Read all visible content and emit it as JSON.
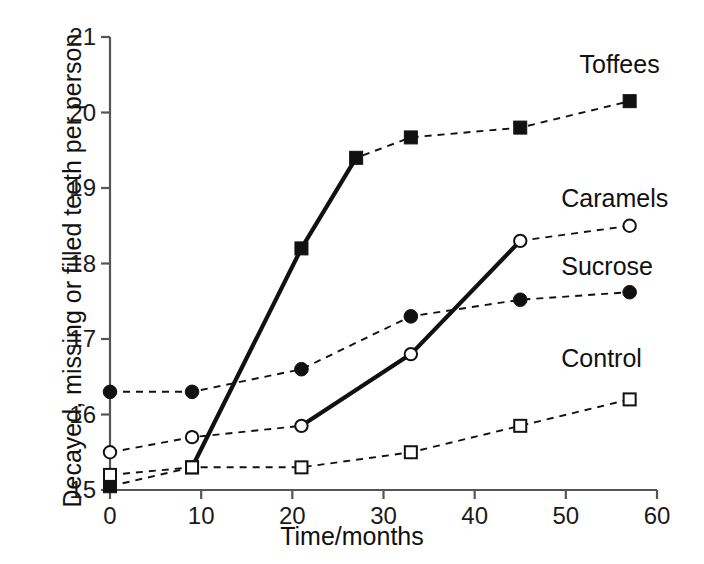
{
  "chart_data": {
    "type": "line",
    "title": "",
    "xlabel": "Time/months",
    "ylabel": "Decayed, missing or filled teeth per person",
    "xlim": [
      0,
      60
    ],
    "ylim": [
      15,
      21
    ],
    "xticks": [
      0,
      10,
      20,
      30,
      40,
      50,
      60
    ],
    "xtick_labels": [
      "0",
      "10",
      "20",
      "30",
      "40",
      "50",
      "60"
    ],
    "yticks": [
      15,
      16,
      17,
      18,
      19,
      20,
      21
    ],
    "ytick_labels": [
      "15",
      "16",
      "17",
      "18",
      "19",
      "20",
      "21"
    ],
    "grid": false,
    "legend_position": "inline-right-of-series",
    "series": [
      {
        "name": "Toffees",
        "marker": "filled-square",
        "label": "Toffees",
        "label_x": 51.5,
        "label_y": 20.62,
        "x": [
          0,
          9,
          21,
          27,
          33,
          45,
          57
        ],
        "y": [
          15.05,
          15.3,
          18.2,
          19.4,
          19.67,
          19.8,
          20.15
        ],
        "solid_segment_x": [
          9,
          21,
          27
        ]
      },
      {
        "name": "Caramels",
        "marker": "open-circle",
        "label": "Caramels",
        "label_x": 49.5,
        "label_y": 18.84,
        "x": [
          0,
          9,
          21,
          33,
          45,
          57
        ],
        "y": [
          15.5,
          15.7,
          15.85,
          16.8,
          18.3,
          18.5
        ],
        "solid_segment_x": [
          21,
          33,
          45
        ]
      },
      {
        "name": "Sucrose",
        "marker": "filled-circle",
        "label": "Sucrose",
        "label_x": 49.5,
        "label_y": 17.94,
        "x": [
          0,
          9,
          21,
          33,
          45,
          57
        ],
        "y": [
          16.3,
          16.3,
          16.6,
          17.3,
          17.52,
          17.62
        ],
        "solid_segment_x": []
      },
      {
        "name": "Control",
        "marker": "open-square",
        "label": "Control",
        "label_x": 49.5,
        "label_y": 16.72,
        "x": [
          0,
          9,
          21,
          33,
          45,
          57
        ],
        "y": [
          15.2,
          15.3,
          15.3,
          15.5,
          15.85,
          16.2
        ],
        "solid_segment_x": []
      }
    ]
  }
}
